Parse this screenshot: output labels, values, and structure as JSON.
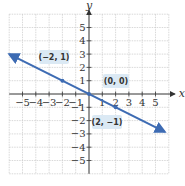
{
  "chart_data": {
    "type": "line",
    "title": "",
    "xlabel": "x",
    "ylabel": "y",
    "xlim": [
      -6,
      6
    ],
    "ylim": [
      -6,
      6
    ],
    "grid": true,
    "x_ticks": [
      -5,
      -4,
      -3,
      -2,
      -1,
      1,
      2,
      3,
      4,
      5
    ],
    "y_ticks": [
      -5,
      -4,
      -3,
      -2,
      -1,
      1,
      2,
      3,
      4,
      5
    ],
    "x_tick_labels": [
      "−5",
      "−4",
      "−3",
      "−2",
      "−1",
      "1",
      "2",
      "3",
      "4",
      "5"
    ],
    "y_tick_labels": [
      "−5",
      "−4",
      "−3",
      "−2",
      "−1",
      "1",
      "2",
      "3",
      "4",
      "5"
    ],
    "series": [
      {
        "name": "y = -x/2",
        "color": "#3d6bb3",
        "x": [
          -6,
          5.7
        ],
        "y": [
          3,
          -2.85
        ],
        "arrows_both_ends": true
      }
    ],
    "points": [
      {
        "x": -2,
        "y": 1,
        "label": "(−2, 1)"
      },
      {
        "x": 0,
        "y": 0,
        "label": "(0, 0)"
      },
      {
        "x": 2,
        "y": -1,
        "label": "(2, −1)"
      }
    ],
    "annotations": [
      "(−2, 1)",
      "(0, 0)",
      "(2, −1)"
    ]
  },
  "colors": {
    "line": "#3d6bb3",
    "grid": "#c8c8c8",
    "axis": "#333333",
    "label_box": "#dbe9f4"
  }
}
